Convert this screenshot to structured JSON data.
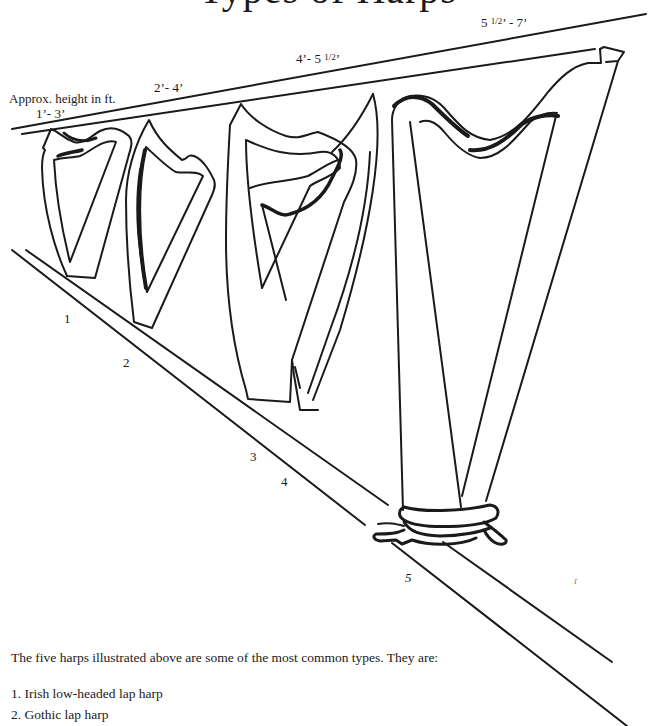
{
  "page": {
    "title": "Types of Harps"
  },
  "illustration": {
    "axis_label": "Approx. height in ft.",
    "height_labels": [
      {
        "harp": 1,
        "text": "1’- 3’"
      },
      {
        "harp": 2,
        "text": "2’- 4’"
      },
      {
        "harp": 3,
        "text": "4’- 5 ",
        "frac": "1/2",
        "suffix": "’"
      },
      {
        "harp": 5,
        "prefix": "5 ",
        "frac": "1/2",
        "text": "’ - 7’"
      }
    ],
    "harp_numbers": [
      "1",
      "2",
      "3",
      "4",
      "5"
    ],
    "stray_mark": "ɾ"
  },
  "body": {
    "intro": "The five harps illustrated above are some of the most common types. They are:",
    "list": [
      "1. Irish low-headed lap harp",
      "2. Gothic lap harp"
    ]
  },
  "colors": {
    "ink": "#1a1a1a",
    "paper": "#ffffff"
  }
}
